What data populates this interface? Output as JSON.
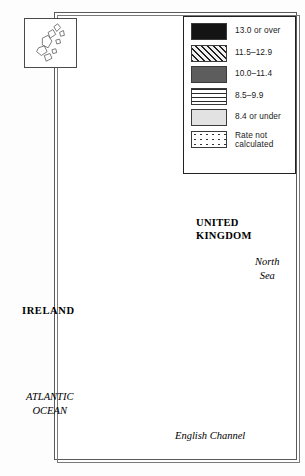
{
  "figure": {
    "type": "choropleth-map",
    "region": "United Kingdom and Ireland",
    "inset_label": "shetland-islands-inset"
  },
  "legend": {
    "items": [
      {
        "pattern": "solid-black",
        "label": "13.0 or over"
      },
      {
        "pattern": "diagonal-hatch",
        "label": "11.5–12.9"
      },
      {
        "pattern": "solid-dark-gray",
        "label": "10.0–11.4"
      },
      {
        "pattern": "horizontal-lines",
        "label": "8.5–9.9"
      },
      {
        "pattern": "solid-light-gray",
        "label": "8.4 or under"
      },
      {
        "pattern": "scattered-dots",
        "label": "Rate not\ncalculated"
      }
    ]
  },
  "map_labels": {
    "united_kingdom": "UNITED\nKINGDOM",
    "ireland": "IRELAND",
    "north_sea": "North\nSea",
    "atlantic_ocean": "ATLANTIC\nOCEAN",
    "english_channel": "English Channel"
  },
  "colors": {
    "solid_black": "#141414",
    "solid_dark_gray": "#5d5d5d",
    "solid_light_gray": "#e2e2e2",
    "hatch_background": "#efefef",
    "outline": "#4a4a4a",
    "page_background": "#ffffff"
  }
}
